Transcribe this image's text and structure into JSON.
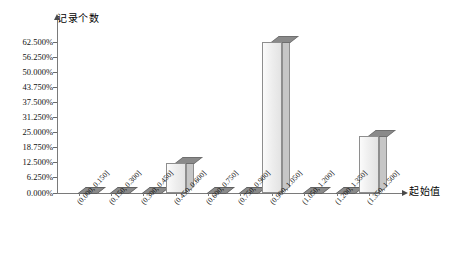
{
  "chart_data": {
    "type": "bar",
    "title": "",
    "subtitle": "",
    "xlabel": "起始值",
    "ylabel": "记录个数",
    "grid": false,
    "legend": "none",
    "value_suffix": "%",
    "ylim": [
      0,
      62.5
    ],
    "ytick_labels": [
      "0.000%",
      "6.250%",
      "12.500%",
      "18.750%",
      "25.000%",
      "31.250%",
      "37.500%",
      "43.750%",
      "50.000%",
      "56.250%",
      "62.500%"
    ],
    "ytick_values": [
      0,
      6.25,
      12.5,
      18.75,
      25,
      31.25,
      37.5,
      43.75,
      50,
      56.25,
      62.5
    ],
    "categories": [
      "(0.000, 0.150]",
      "(0.150, 0.300]",
      "(0.300, 0.450]",
      "(0.450, 0.600]",
      "(0.600, 0.750]",
      "(0.750, 0.900]",
      "(0.900, 1.050]",
      "(1.050, 1.200]",
      "(1.200, 1.350]",
      "(1.350, 1.500]"
    ],
    "values": [
      0,
      0,
      0,
      12.5,
      0,
      0,
      62.5,
      0,
      0,
      23.5
    ],
    "colors": {
      "bar_front": "#ecECec",
      "bar_top": "#8a8a8a",
      "bar_side": "#c6c6c6",
      "axis": "#7a7a7a",
      "text": "#111111",
      "background": "#ffffff"
    }
  }
}
